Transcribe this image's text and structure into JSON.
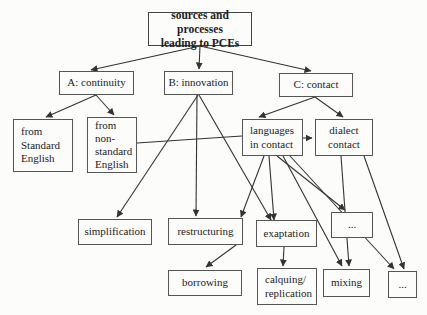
{
  "figure": {
    "type": "tree-diagram",
    "background": "#fcfcfb",
    "line_color": "#333333",
    "box_border_color": "#555555"
  },
  "nodes": {
    "root": {
      "label": "sources and processes\nleading to PCEs"
    },
    "continuity": {
      "label": "A: continuity"
    },
    "innovation": {
      "label": "B: innovation"
    },
    "contact": {
      "label": "C: contact"
    },
    "from_standard": {
      "label": "from\nStandard\nEnglish"
    },
    "from_nonstandard": {
      "label": "from\nnon-\nstandard\nEnglish"
    },
    "languages_in_contact": {
      "label": "languages\nin contact"
    },
    "dialect_contact": {
      "label": "dialect\ncontact"
    },
    "simplification": {
      "label": "simplification"
    },
    "restructuring": {
      "label": "restructuring"
    },
    "exaptation": {
      "label": "exaptation"
    },
    "dots_level3": {
      "label": "..."
    },
    "borrowing": {
      "label": "borrowing"
    },
    "calquing": {
      "label": "calquing/\nreplication"
    },
    "mixing": {
      "label": "mixing"
    },
    "dots_level4": {
      "label": "..."
    }
  },
  "edges": [
    {
      "from": "root",
      "to": "continuity",
      "x1": 200,
      "y1": 46,
      "x2": 91,
      "y2": 70,
      "arrow": true
    },
    {
      "from": "root",
      "to": "innovation",
      "x1": 200,
      "y1": 46,
      "x2": 199,
      "y2": 69,
      "arrow": true
    },
    {
      "from": "root",
      "to": "contact",
      "x1": 200,
      "y1": 46,
      "x2": 311,
      "y2": 71,
      "arrow": true
    },
    {
      "from": "continuity",
      "to": "from_standard",
      "x1": 96,
      "y1": 95,
      "x2": 46,
      "y2": 117,
      "arrow": true
    },
    {
      "from": "continuity",
      "to": "from_nonstandard",
      "x1": 96,
      "y1": 95,
      "x2": 114,
      "y2": 115,
      "arrow": true
    },
    {
      "from": "contact",
      "to": "languages_in_contact",
      "x1": 315,
      "y1": 97,
      "x2": 259,
      "y2": 117,
      "arrow": true
    },
    {
      "from": "contact",
      "to": "dialect_contact",
      "x1": 315,
      "y1": 97,
      "x2": 343,
      "y2": 117,
      "arrow": true
    },
    {
      "from": "languages_in_contact",
      "to": "dialect_contact",
      "x1": 303,
      "y1": 138,
      "x2": 312,
      "y2": 138,
      "arrow": true
    },
    {
      "from": "from_nonstandard",
      "to": "languages_in_contact",
      "x1": 137,
      "y1": 143,
      "x2": 242,
      "y2": 136,
      "arrow": false
    },
    {
      "from": "innovation",
      "to": "simplification",
      "x1": 198,
      "y1": 95,
      "x2": 117,
      "y2": 217,
      "arrow": true
    },
    {
      "from": "innovation",
      "to": "restructuring",
      "x1": 197,
      "y1": 95,
      "x2": 196,
      "y2": 216,
      "arrow": true
    },
    {
      "from": "innovation",
      "to": "exaptation",
      "x1": 199,
      "y1": 95,
      "x2": 271,
      "y2": 220,
      "arrow": true
    },
    {
      "from": "languages_in_contact",
      "to": "restructuring",
      "x1": 264,
      "y1": 156,
      "x2": 241,
      "y2": 217,
      "arrow": true
    },
    {
      "from": "languages_in_contact",
      "to": "exaptation",
      "x1": 269,
      "y1": 156,
      "x2": 274,
      "y2": 220,
      "arrow": true
    },
    {
      "from": "languages_in_contact",
      "to": "dots_level3",
      "x1": 277,
      "y1": 156,
      "x2": 345,
      "y2": 210,
      "arrow": true
    },
    {
      "from": "languages_in_contact",
      "to": "mixing",
      "x1": 283,
      "y1": 156,
      "x2": 342,
      "y2": 266,
      "arrow": true
    },
    {
      "from": "languages_in_contact",
      "to": "dots_level4",
      "x1": 290,
      "y1": 156,
      "x2": 394,
      "y2": 269,
      "arrow": true
    },
    {
      "from": "dialect_contact",
      "to": "mixing",
      "x1": 341,
      "y1": 156,
      "x2": 349,
      "y2": 266,
      "arrow": true
    },
    {
      "from": "dialect_contact",
      "to": "dots_level4",
      "x1": 364,
      "y1": 156,
      "x2": 404,
      "y2": 269,
      "arrow": true
    },
    {
      "from": "restructuring",
      "to": "borrowing",
      "x1": 236,
      "y1": 245,
      "x2": 206,
      "y2": 267,
      "arrow": true
    },
    {
      "from": "exaptation",
      "to": "calquing",
      "x1": 284,
      "y1": 247,
      "x2": 283,
      "y2": 266,
      "arrow": true
    }
  ],
  "layout": {
    "root": {
      "x": 148,
      "y": 12,
      "w": 104,
      "h": 34
    },
    "continuity": {
      "x": 59,
      "y": 71,
      "w": 75,
      "h": 24
    },
    "innovation": {
      "x": 164,
      "y": 71,
      "w": 69,
      "h": 24
    },
    "contact": {
      "x": 279,
      "y": 73,
      "w": 74,
      "h": 24
    },
    "from_standard": {
      "x": 13,
      "y": 119,
      "w": 60,
      "h": 53
    },
    "from_nonstandard": {
      "x": 87,
      "y": 117,
      "w": 50,
      "h": 56
    },
    "languages_in_contact": {
      "x": 242,
      "y": 119,
      "w": 61,
      "h": 37
    },
    "dialect_contact": {
      "x": 315,
      "y": 119,
      "w": 58,
      "h": 37
    },
    "simplification": {
      "x": 78,
      "y": 219,
      "w": 74,
      "h": 26
    },
    "restructuring": {
      "x": 168,
      "y": 218,
      "w": 75,
      "h": 27
    },
    "exaptation": {
      "x": 256,
      "y": 220,
      "w": 61,
      "h": 27
    },
    "dots_level3": {
      "x": 331,
      "y": 212,
      "w": 42,
      "h": 26
    },
    "borrowing": {
      "x": 168,
      "y": 270,
      "w": 74,
      "h": 26
    },
    "calquing": {
      "x": 257,
      "y": 268,
      "w": 60,
      "h": 37
    },
    "mixing": {
      "x": 323,
      "y": 269,
      "w": 47,
      "h": 28
    },
    "dots_level4": {
      "x": 388,
      "y": 271,
      "w": 29,
      "h": 27
    }
  }
}
